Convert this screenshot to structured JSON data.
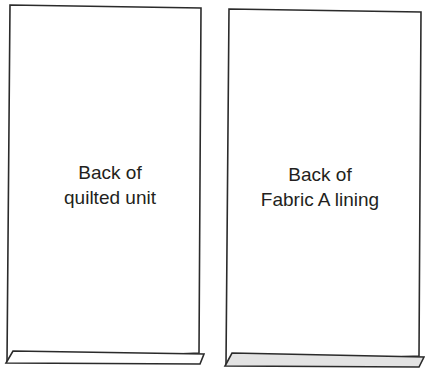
{
  "diagram": {
    "panels": [
      {
        "id": "quilted-unit",
        "label_line1": "Back of",
        "label_line2": "quilted unit",
        "flap_fill": "#ffffff"
      },
      {
        "id": "fabric-a-lining",
        "label_line1": "Back of",
        "label_line2": "Fabric A lining",
        "flap_fill": "#e3e3e3"
      }
    ],
    "colors": {
      "stroke": "#2b2b2b",
      "text": "#231f20",
      "background": "#ffffff"
    }
  }
}
